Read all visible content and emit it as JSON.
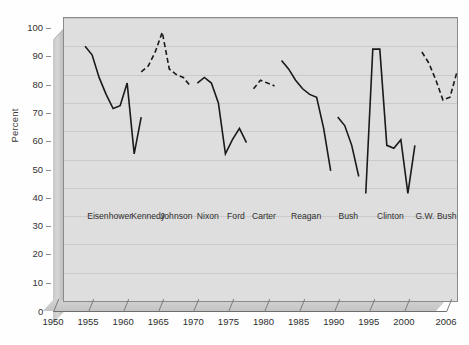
{
  "chart_data": {
    "type": "line",
    "title": "",
    "xlabel": "",
    "ylabel": "Percent",
    "xlim": [
      1950,
      2006
    ],
    "ylim": [
      0,
      100
    ],
    "grid": true,
    "legend": "none",
    "ytick_labels": [
      "0",
      "10",
      "20",
      "30",
      "40",
      "50",
      "60",
      "70",
      "80",
      "90",
      "100"
    ],
    "ytick_values": [
      0,
      10,
      20,
      30,
      40,
      50,
      60,
      70,
      80,
      90,
      100
    ],
    "xtick_labels": [
      "1950",
      "1955",
      "1960",
      "1965",
      "1970",
      "1975",
      "1980",
      "1985",
      "1990",
      "1995",
      "2000",
      "2006"
    ],
    "xtick_values": [
      1950,
      1955,
      1960,
      1965,
      1970,
      1975,
      1980,
      1985,
      1990,
      1995,
      2000,
      2006
    ],
    "annotations": [
      {
        "text": "Eisenhower",
        "year": 1956.5,
        "percent": 30
      },
      {
        "text": "Kennedy",
        "year": 1962.0,
        "percent": 30
      },
      {
        "text": "Johnson",
        "year": 1966.0,
        "percent": 30
      },
      {
        "text": "Nixon",
        "year": 1970.5,
        "percent": 30
      },
      {
        "text": "Ford",
        "year": 1974.5,
        "percent": 30
      },
      {
        "text": "Carter",
        "year": 1978.5,
        "percent": 30
      },
      {
        "text": "Reagan",
        "year": 1984.5,
        "percent": 30
      },
      {
        "text": "Bush",
        "year": 1990.5,
        "percent": 30
      },
      {
        "text": "Clinton",
        "year": 1996.5,
        "percent": 30
      },
      {
        "text": "G.W. Bush",
        "year": 2003.0,
        "percent": 30
      }
    ],
    "series": [
      {
        "name": "Eisenhower",
        "style": "solid",
        "color": "#1a1a1a",
        "x": [
          1953,
          1954,
          1955,
          1956,
          1957,
          1958,
          1959,
          1960,
          1961
        ],
        "values": [
          90,
          87,
          79,
          73,
          68,
          69,
          77,
          52,
          65
        ]
      },
      {
        "name": "Kennedy-Johnson",
        "style": "dashed",
        "color": "#1a1a1a",
        "x": [
          1961,
          1962,
          1963,
          1964,
          1965,
          1966,
          1967,
          1968
        ],
        "values": [
          81,
          83,
          88,
          95,
          82,
          80,
          79,
          76
        ]
      },
      {
        "name": "Nixon-Ford",
        "style": "solid",
        "color": "#1a1a1a",
        "x": [
          1969,
          1970,
          1971,
          1972,
          1973,
          1974,
          1975,
          1976
        ],
        "values": [
          77,
          79,
          77,
          70,
          52,
          57,
          61,
          56
        ]
      },
      {
        "name": "Carter",
        "style": "dashed",
        "color": "#1a1a1a",
        "x": [
          1977,
          1978,
          1979,
          1980
        ],
        "values": [
          75,
          78,
          77,
          76
        ]
      },
      {
        "name": "Reagan",
        "style": "solid",
        "color": "#1a1a1a",
        "x": [
          1981,
          1982,
          1983,
          1984,
          1985,
          1986,
          1987,
          1988
        ],
        "values": [
          85,
          82,
          78,
          75,
          73,
          72,
          61,
          46
        ]
      },
      {
        "name": "Bush",
        "style": "solid",
        "color": "#1a1a1a",
        "x": [
          1989,
          1990,
          1991,
          1992
        ],
        "values": [
          65,
          62,
          55,
          44
        ]
      },
      {
        "name": "Clinton",
        "style": "solid",
        "color": "#1a1a1a",
        "x": [
          1993,
          1994,
          1995,
          1996,
          1997,
          1998,
          1999,
          2000
        ],
        "values": [
          38,
          89,
          89,
          55,
          54,
          57,
          38,
          55
        ]
      },
      {
        "name": "G.W. Bush",
        "style": "dashed",
        "color": "#1a1a1a",
        "x": [
          2001,
          2002,
          2003,
          2004,
          2005,
          2006
        ],
        "values": [
          88,
          84,
          78,
          71,
          72,
          81
        ]
      }
    ]
  },
  "axis": {
    "y_title": "Percent",
    "zero_label": "0"
  }
}
